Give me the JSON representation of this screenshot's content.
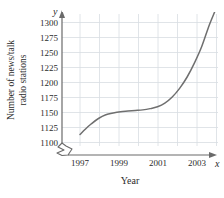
{
  "chart_data": {
    "type": "line",
    "title": "",
    "xlabel": "Year",
    "ylabel": "Number of news/talk radio stations",
    "ylabel_line1": "Number of news/talk",
    "ylabel_line2": "radio stations",
    "x_axis_variable": "x",
    "y_axis_variable": "y",
    "xlim": [
      1997,
      2004.4
    ],
    "ylim": [
      1100,
      1312
    ],
    "grid": true,
    "legend": null,
    "axis_break": true,
    "y_ticks": [
      1100,
      1125,
      1150,
      1175,
      1200,
      1225,
      1250,
      1275,
      1300
    ],
    "y_tick_labels": [
      "1100",
      "1125",
      "1150",
      "1175",
      "1200",
      "1225",
      "1250",
      "1275",
      "1300"
    ],
    "x_ticks": [
      1997,
      1998,
      1999,
      2000,
      2001,
      2002,
      2003,
      2004
    ],
    "x_tick_labels": [
      "1997",
      "",
      "1999",
      "",
      "2001",
      "",
      "2003",
      ""
    ],
    "x_labeled_ticks": [
      1997,
      1999,
      2001,
      2003
    ],
    "series": [
      {
        "name": "News/talk radio stations",
        "color": "#6f6f6f",
        "x": [
          1997.0,
          1997.3,
          1997.6,
          1998.0,
          1998.4,
          1998.8,
          1999.2,
          1999.6,
          2000.0,
          2000.4,
          2000.8,
          2001.2,
          2001.6,
          2002.0,
          2002.4,
          2002.8,
          2003.2,
          2003.6,
          2004.0,
          2004.3
        ],
        "values": [
          1113,
          1122,
          1130,
          1139,
          1145,
          1148,
          1150,
          1151,
          1152,
          1153,
          1155,
          1158,
          1164,
          1174,
          1188,
          1206,
          1229,
          1256,
          1290,
          1312
        ]
      }
    ]
  },
  "colors": {
    "curve": "#6f6f6f",
    "axis": "#6a6a6a",
    "grid": "#d8dde2",
    "text": "#2b2b2b",
    "background": "#ffffff"
  }
}
